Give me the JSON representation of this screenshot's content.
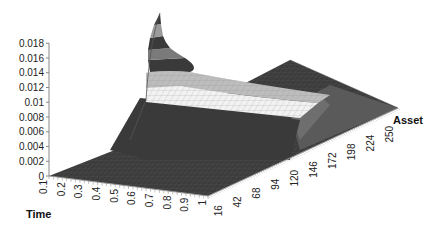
{
  "chart_data": {
    "type": "surface3d",
    "title": "",
    "xlabel": "Time",
    "ylabel": "Asset",
    "zlabel": "",
    "x_ticks": [
      "0.1",
      "0.2",
      "0.3",
      "0.4",
      "0.5",
      "0.6",
      "0.7",
      "0.8",
      "0.9",
      "1"
    ],
    "y_ticks": [
      "16",
      "42",
      "68",
      "94",
      "120",
      "146",
      "172",
      "198",
      "224",
      "250"
    ],
    "z_ticks": [
      "0",
      "0.002",
      "0.004",
      "0.006",
      "0.008",
      "0.01",
      "0.012",
      "0.014",
      "0.016",
      "0.018"
    ],
    "zlim": [
      0,
      0.018
    ],
    "grid": true,
    "legend": "none",
    "surface_bands_colors": [
      "#3a3a3a",
      "#9a9a9a",
      "#3a3a3a",
      "#7a7a7a",
      "#3a3a3a",
      "#bdbdbd",
      "#f2f2f2",
      "#4a4a4a"
    ]
  },
  "labels": {
    "x_axis_title": "Time",
    "y_axis_title": "Asset"
  }
}
